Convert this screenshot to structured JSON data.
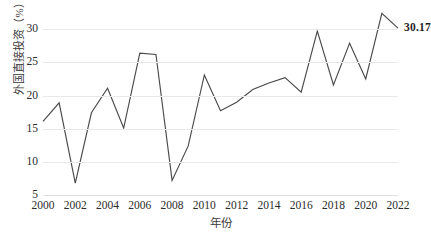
{
  "chart_data": {
    "type": "line",
    "title": "",
    "xlabel": "年份",
    "ylabel": "外国直接投资（%）",
    "xlim": [
      2000,
      2022
    ],
    "ylim": [
      5,
      33.5
    ],
    "yticks": [
      5,
      10,
      15,
      20,
      25,
      30
    ],
    "ytick_labels": [
      "5",
      "10",
      "15",
      "20",
      "25",
      "30"
    ],
    "xticks": [
      2000,
      2002,
      2004,
      2006,
      2008,
      2010,
      2012,
      2014,
      2016,
      2018,
      2020,
      2022
    ],
    "xtick_labels": [
      "2000",
      "2002",
      "2004",
      "2006",
      "2008",
      "2010",
      "2012",
      "2014",
      "2016",
      "2018",
      "2020",
      "2022"
    ],
    "grid": "horizontal",
    "legend": "none",
    "line_color": "#4a4a4a",
    "grid_color": "#e9e9e9",
    "x": [
      2000,
      2001,
      2002,
      2003,
      2004,
      2005,
      2006,
      2007,
      2008,
      2009,
      2010,
      2011,
      2012,
      2013,
      2014,
      2015,
      2016,
      2017,
      2018,
      2019,
      2020,
      2021,
      2022
    ],
    "values": [
      16.1,
      18.9,
      6.8,
      17.4,
      21.1,
      15.1,
      26.4,
      26.2,
      7.2,
      12.4,
      23.1,
      17.7,
      19.0,
      20.9,
      21.9,
      22.7,
      20.5,
      29.7,
      21.6,
      27.9,
      22.5,
      32.4,
      30.17
    ],
    "series": [
      {
        "name": "外国直接投资",
        "values": [
          16.1,
          18.9,
          6.8,
          17.4,
          21.1,
          15.1,
          26.4,
          26.2,
          7.2,
          12.4,
          23.1,
          17.7,
          19.0,
          20.9,
          21.9,
          22.7,
          20.5,
          29.7,
          21.6,
          27.9,
          22.5,
          32.4,
          30.17
        ]
      }
    ],
    "annotations": [
      {
        "text": "30.17",
        "x": 2022,
        "y": 30.17
      }
    ]
  }
}
